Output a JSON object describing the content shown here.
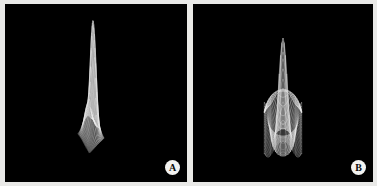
{
  "figure": {
    "background_color": "#e9e9e7",
    "panel_background_color": "#000000",
    "mesh_color": "#f0f0f0",
    "panel_count": 2
  },
  "panels": [
    {
      "id": "panel-a",
      "badge_label": "A",
      "badge_color": "#f2f2f0",
      "badge_text_color": "#0a0a0a",
      "description": "3D wireframe mesh surface with an asymmetric double ridge peak rising at back-right and a broad sloping skirt toward the front-left"
    },
    {
      "id": "panel-b",
      "badge_label": "B",
      "badge_color": "#f2f2f0",
      "badge_text_color": "#0a0a0a",
      "description": "3D wireframe mesh surface with a single tall symmetric central peak surrounded by concentric ripple rings"
    }
  ],
  "chart_data": [
    {
      "type": "surface",
      "panel": "A",
      "title": "",
      "xlabel": "",
      "ylabel": "",
      "zlabel": "",
      "grid": true,
      "legend": false,
      "wireframe": true,
      "grid_rows": 28,
      "grid_cols": 28,
      "x_range": [
        -3.0,
        3.0
      ],
      "y_range": [
        -3.0,
        3.0
      ],
      "z_range": [
        0.0,
        1.0
      ],
      "projection": {
        "azimuth_deg": -52,
        "elevation_deg": 22,
        "scale_x": 3.1,
        "scale_y": 1.35,
        "scale_z": 88
      },
      "surface_formula": "sum of gaussian lobes",
      "components": [
        {
          "amp": 1.0,
          "cx": 0.95,
          "cy": 0.55,
          "sx": 0.62,
          "sy": 0.92
        },
        {
          "amp": 0.72,
          "cx": 0.05,
          "cy": 0.3,
          "sx": 0.55,
          "sy": 0.7
        },
        {
          "amp": 0.3,
          "cx": -1.15,
          "cy": -0.55,
          "sx": 1.05,
          "sy": 0.95
        },
        {
          "amp": 0.16,
          "cx": -1.9,
          "cy": 1.1,
          "sx": 0.9,
          "sy": 0.85
        }
      ]
    },
    {
      "type": "surface",
      "panel": "B",
      "title": "",
      "xlabel": "",
      "ylabel": "",
      "zlabel": "",
      "grid": true,
      "legend": false,
      "wireframe": true,
      "grid_rows": 30,
      "grid_cols": 30,
      "x_range": [
        -8.5,
        8.5
      ],
      "y_range": [
        -8.5,
        8.5
      ],
      "z_range": [
        -0.25,
        1.0
      ],
      "projection": {
        "azimuth_deg": 0,
        "elevation_deg": 20,
        "scale_x": 2.2,
        "scale_y": 1.0,
        "scale_z": 86
      },
      "surface_formula": "sinc radial: sin(r)/r",
      "components": [
        {
          "amp": 1.0,
          "freq": 1.0,
          "decay": 0.0
        }
      ]
    }
  ]
}
